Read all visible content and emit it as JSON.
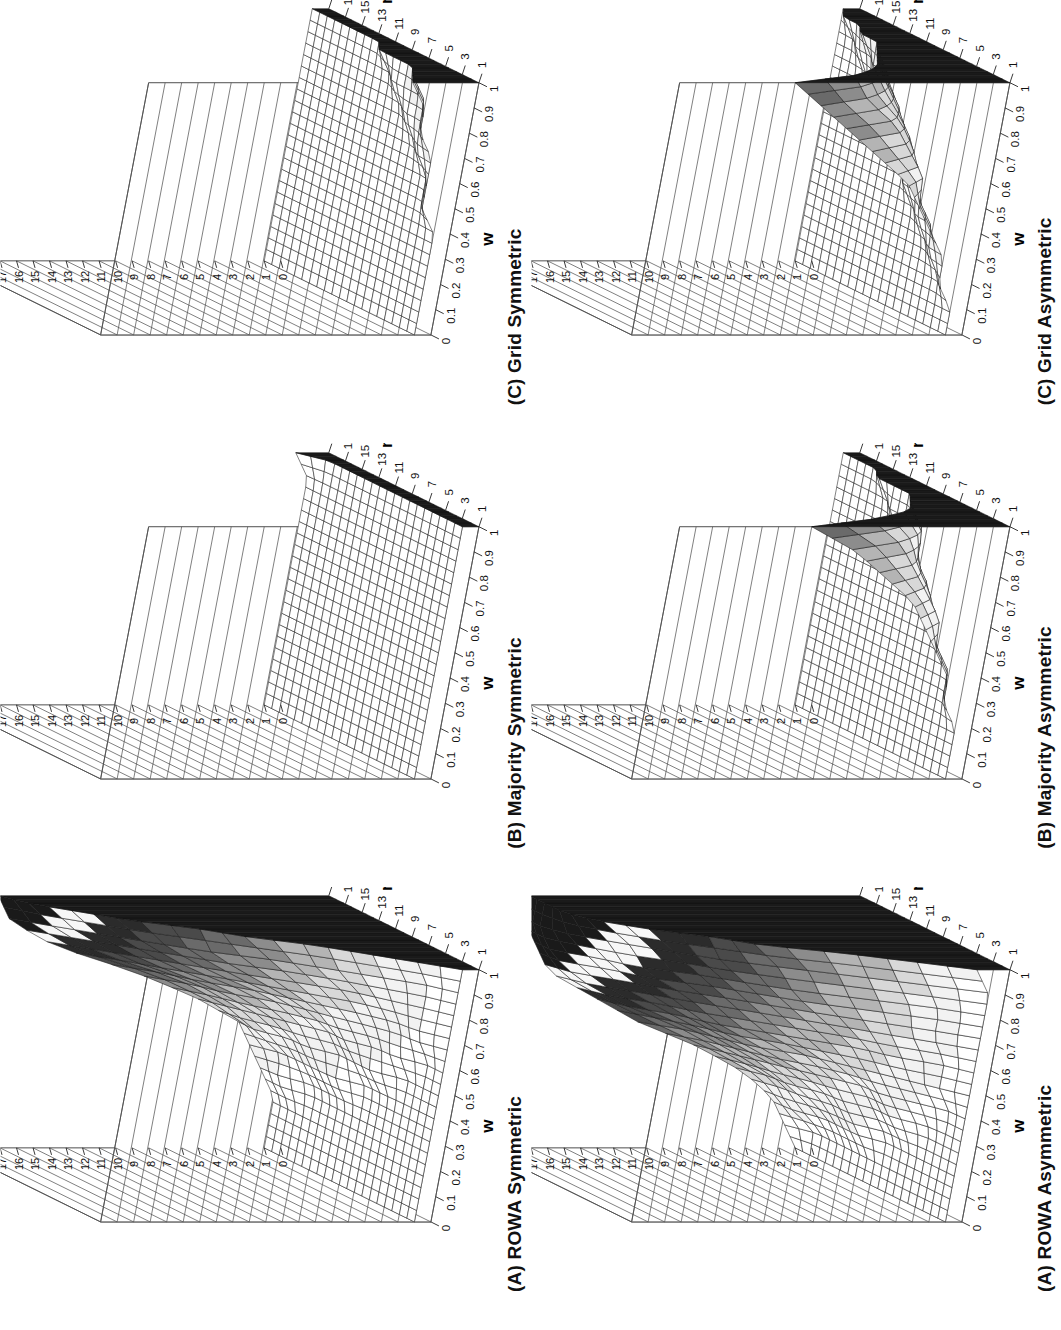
{
  "figure": {
    "orientation": "rotated-90-ccw",
    "background": "#ffffff",
    "rows": 2,
    "cols": 3
  },
  "axes": {
    "w": {
      "label": "w",
      "ticks": [
        "0",
        "0.1",
        "0.2",
        "0.3",
        "0.4",
        "0.5",
        "0.6",
        "0.7",
        "0.8",
        "0.9",
        "1"
      ],
      "min": 0,
      "max": 1
    },
    "n": {
      "label": "n",
      "ticks": [
        "1",
        "3",
        "5",
        "7",
        "9",
        "11",
        "13",
        "15",
        "17",
        "19"
      ],
      "min": 1,
      "max": 19
    },
    "so": {
      "label": "SO",
      "ticks": [
        "0",
        "1",
        "2",
        "3",
        "4",
        "5",
        "6",
        "7",
        "8",
        "9",
        "10",
        "11",
        "12",
        "13",
        "14",
        "15",
        "16",
        "17",
        "18",
        "19",
        "20"
      ],
      "min": 0,
      "max": 20
    }
  },
  "panels": [
    {
      "id": "a-symmetric",
      "title": "(A) ROWA Symmetric",
      "so_label": "SO",
      "show_so_axis": true,
      "surface": "rowa-symmetric"
    },
    {
      "id": "b-symmetric",
      "title": "(B) Majority Symmetric",
      "so_label": "SO",
      "show_so_axis": true,
      "surface": "majority-symmetric"
    },
    {
      "id": "c-symmetric",
      "title": "(C) Grid Symmetric",
      "so_label": "",
      "show_so_axis": true,
      "surface": "grid-symmetric"
    },
    {
      "id": "a-asymmetric",
      "title": "(A) ROWA Asymmetric",
      "so_label": "SO",
      "show_so_axis": true,
      "surface": "rowa-asymmetric"
    },
    {
      "id": "b-asymmetric",
      "title": "(B) Majority Asymmetric",
      "so_label": "SO",
      "show_so_axis": true,
      "surface": "majority-asymmetric"
    },
    {
      "id": "c-asymmetric",
      "title": "(C) Grid Asymmetric",
      "so_label": "",
      "show_so_axis": true,
      "surface": "grid-asymmetric"
    }
  ],
  "chart_data": {
    "type": "surface",
    "title": "",
    "xlabel": "w",
    "ylabel": "n",
    "zlabel": "SO",
    "xlim": [
      0,
      1
    ],
    "ylim": [
      1,
      19
    ],
    "zlim": [
      0,
      20
    ],
    "grid": true,
    "legend": "none",
    "colormap": "grayscale-banded",
    "x": [
      0,
      0.1,
      0.2,
      0.3,
      0.4,
      0.5,
      0.6,
      0.7,
      0.8,
      0.9,
      1
    ],
    "y": [
      1,
      3,
      5,
      7,
      9,
      11,
      13,
      15,
      17,
      19
    ],
    "surfaces": [
      {
        "name": "(A) ROWA Symmetric",
        "description": "SO rises steeply toward large n and large w, peaking near 20 at the far corner; low plateau near 1-2 across small w.",
        "z": [
          [
            1,
            1,
            1,
            1,
            1,
            1,
            1,
            1,
            1,
            1
          ],
          [
            1,
            1,
            1,
            1,
            1,
            1,
            1,
            1,
            1,
            1
          ],
          [
            1,
            1,
            1,
            1,
            1,
            1,
            1,
            1,
            1,
            1
          ],
          [
            1,
            1,
            1,
            1,
            1,
            1,
            1,
            1,
            2,
            2
          ],
          [
            1,
            1,
            1,
            1,
            1,
            2,
            2,
            2,
            2,
            3
          ],
          [
            1,
            1,
            1,
            2,
            2,
            2,
            3,
            3,
            4,
            4
          ],
          [
            1,
            1,
            2,
            2,
            3,
            3,
            4,
            5,
            6,
            7
          ],
          [
            1,
            2,
            2,
            3,
            4,
            5,
            6,
            8,
            9,
            11
          ],
          [
            1,
            2,
            3,
            4,
            6,
            8,
            10,
            12,
            14,
            16
          ],
          [
            1,
            2,
            4,
            6,
            8,
            11,
            13,
            15,
            17,
            19
          ],
          [
            1,
            3,
            5,
            7,
            10,
            12,
            15,
            17,
            19,
            20
          ]
        ]
      },
      {
        "name": "(B) Majority Symmetric",
        "description": "Essentially flat at SO = 1 over the whole (w, n) domain.",
        "z": [
          [
            1,
            1,
            1,
            1,
            1,
            1,
            1,
            1,
            1,
            1
          ],
          [
            1,
            1,
            1,
            1,
            1,
            1,
            1,
            1,
            1,
            1
          ],
          [
            1,
            1,
            1,
            1,
            1,
            1,
            1,
            1,
            1,
            1
          ],
          [
            1,
            1,
            1,
            1,
            1,
            1,
            1,
            1,
            1,
            1
          ],
          [
            1,
            1,
            1,
            1,
            1,
            1,
            1,
            1,
            1,
            1
          ],
          [
            1,
            1,
            1,
            1,
            1,
            1,
            1,
            1,
            1,
            1
          ],
          [
            1,
            1,
            1,
            1,
            1,
            1,
            1,
            1,
            1,
            1
          ],
          [
            1,
            1,
            1,
            1,
            1,
            1,
            1,
            1,
            1,
            1
          ],
          [
            1,
            1,
            1,
            1,
            1,
            1,
            1,
            1,
            1,
            1
          ],
          [
            1,
            1,
            1,
            1,
            1,
            1,
            1,
            1,
            1,
            1
          ],
          [
            1,
            1,
            1,
            1,
            1,
            1,
            1,
            1,
            1,
            2
          ]
        ]
      },
      {
        "name": "(C) Grid Symmetric",
        "description": "Flat low surface near SO = 1-2, with a slight rise for the smallest n at large w.",
        "z": [
          [
            1,
            1,
            1,
            1,
            1,
            1,
            1,
            1,
            1,
            1
          ],
          [
            1,
            1,
            1,
            1,
            1,
            1,
            1,
            1,
            1,
            1
          ],
          [
            1,
            1,
            1,
            1,
            1,
            1,
            1,
            1,
            1,
            1
          ],
          [
            1,
            1,
            1,
            1,
            1,
            1,
            1,
            1,
            1,
            1
          ],
          [
            1,
            1,
            1,
            1,
            1,
            1,
            1,
            1,
            1,
            1
          ],
          [
            2,
            1,
            1,
            1,
            1,
            1,
            1,
            1,
            1,
            1
          ],
          [
            2,
            1,
            1,
            1,
            1,
            1,
            1,
            1,
            1,
            1
          ],
          [
            2,
            2,
            1,
            1,
            1,
            1,
            1,
            1,
            1,
            1
          ],
          [
            3,
            2,
            2,
            1,
            1,
            1,
            1,
            1,
            1,
            1
          ],
          [
            3,
            2,
            2,
            2,
            1,
            1,
            1,
            1,
            1,
            1
          ],
          [
            4,
            3,
            2,
            2,
            2,
            1,
            1,
            1,
            1,
            1
          ]
        ]
      },
      {
        "name": "(A) ROWA Asymmetric",
        "description": "Strong monotone increase with both w and n; broad banded ramp reaching SO = 20 at w = 1, n = 19.",
        "z": [
          [
            1,
            1,
            1,
            1,
            1,
            1,
            1,
            1,
            1,
            1
          ],
          [
            1,
            1,
            1,
            1,
            1,
            1,
            1,
            1,
            1,
            2
          ],
          [
            1,
            1,
            1,
            1,
            1,
            2,
            2,
            2,
            3,
            3
          ],
          [
            1,
            1,
            1,
            2,
            2,
            3,
            3,
            4,
            4,
            5
          ],
          [
            1,
            1,
            2,
            3,
            3,
            4,
            5,
            6,
            7,
            8
          ],
          [
            1,
            2,
            3,
            4,
            5,
            6,
            8,
            9,
            10,
            12
          ],
          [
            1,
            2,
            4,
            5,
            7,
            9,
            11,
            12,
            14,
            15
          ],
          [
            1,
            3,
            5,
            7,
            9,
            11,
            13,
            15,
            17,
            18
          ],
          [
            1,
            3,
            6,
            9,
            11,
            13,
            16,
            17,
            19,
            19
          ],
          [
            1,
            4,
            7,
            10,
            13,
            15,
            17,
            19,
            20,
            20
          ],
          [
            2,
            5,
            8,
            12,
            14,
            17,
            19,
            20,
            20,
            20
          ]
        ]
      },
      {
        "name": "(B) Majority Asymmetric",
        "description": "Flat near SO = 1 for most of the domain, with a narrow ridge climbing at the smallest n and largest w.",
        "z": [
          [
            1,
            1,
            1,
            1,
            1,
            1,
            1,
            1,
            1,
            1
          ],
          [
            1,
            1,
            1,
            1,
            1,
            1,
            1,
            1,
            1,
            1
          ],
          [
            1,
            1,
            1,
            1,
            1,
            1,
            1,
            1,
            1,
            1
          ],
          [
            2,
            1,
            1,
            1,
            1,
            1,
            1,
            1,
            1,
            1
          ],
          [
            2,
            1,
            1,
            1,
            1,
            1,
            1,
            1,
            1,
            1
          ],
          [
            3,
            2,
            1,
            1,
            1,
            1,
            1,
            1,
            1,
            1
          ],
          [
            4,
            2,
            2,
            1,
            1,
            1,
            1,
            1,
            1,
            1
          ],
          [
            5,
            3,
            2,
            2,
            1,
            1,
            1,
            1,
            1,
            1
          ],
          [
            7,
            4,
            3,
            2,
            2,
            1,
            1,
            1,
            1,
            1
          ],
          [
            9,
            5,
            3,
            2,
            2,
            2,
            1,
            1,
            1,
            1
          ],
          [
            12,
            7,
            4,
            3,
            2,
            2,
            2,
            1,
            1,
            1
          ]
        ]
      },
      {
        "name": "(C) Grid Asymmetric",
        "description": "Low plateau near SO = 1-3 with a pronounced peak at the smallest n and largest w reaching about SO = 13.",
        "z": [
          [
            1,
            1,
            1,
            1,
            1,
            1,
            1,
            1,
            1,
            1
          ],
          [
            1,
            1,
            1,
            1,
            1,
            1,
            1,
            1,
            1,
            1
          ],
          [
            2,
            1,
            1,
            1,
            1,
            1,
            1,
            1,
            1,
            1
          ],
          [
            2,
            2,
            1,
            1,
            1,
            1,
            1,
            1,
            1,
            1
          ],
          [
            3,
            2,
            2,
            1,
            1,
            1,
            1,
            1,
            1,
            1
          ],
          [
            4,
            3,
            2,
            2,
            1,
            1,
            1,
            1,
            1,
            1
          ],
          [
            5,
            3,
            3,
            2,
            2,
            1,
            1,
            1,
            1,
            1
          ],
          [
            7,
            4,
            3,
            3,
            2,
            2,
            1,
            1,
            1,
            1
          ],
          [
            9,
            5,
            4,
            3,
            3,
            2,
            2,
            1,
            1,
            1
          ],
          [
            11,
            7,
            5,
            4,
            3,
            3,
            2,
            2,
            1,
            1
          ],
          [
            13,
            8,
            6,
            5,
            4,
            3,
            3,
            2,
            2,
            1
          ]
        ]
      }
    ]
  }
}
